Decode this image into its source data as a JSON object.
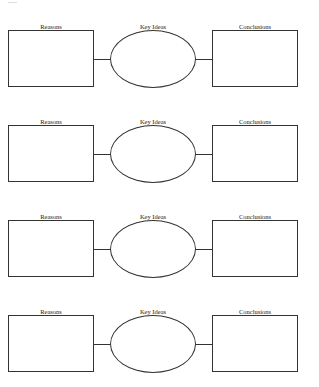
{
  "diagram": {
    "type": "graphic-organizer",
    "rows": [
      {
        "left_label": "Reasons",
        "center_label": "Key Ideas",
        "right_label": "Conclusions"
      },
      {
        "left_label": "Reasons",
        "center_label": "Key Ideas",
        "right_label": "Conclusions"
      },
      {
        "left_label": "Reasons",
        "center_label": "Key Ideas",
        "right_label": "Conclusions"
      },
      {
        "left_label": "Reasons",
        "center_label": "Key Ideas",
        "right_label": "Conclusions"
      }
    ],
    "colors": {
      "stroke": "#333333",
      "background": "#ffffff"
    }
  }
}
